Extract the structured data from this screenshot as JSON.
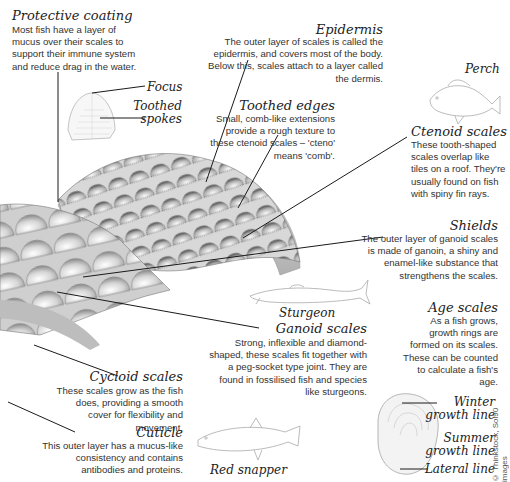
{
  "annotations": {
    "protective_coating": {
      "title": "Protective coating",
      "text": "Most fish have a layer of mucus over their scales to support their immune system and reduce drag in the water."
    },
    "epidermis": {
      "title": "Epidermis",
      "text": "The outer layer of scales is called the epidermis, and covers most of the body. Below this, scales attach to a layer called the dermis."
    },
    "focus": {
      "title": "Focus"
    },
    "toothed_spokes": {
      "title": "Toothed spokes"
    },
    "toothed_edges": {
      "title": "Toothed edges",
      "text": "Small, comb-like extensions provide a rough texture to these ctenoid scales – 'cteno' means 'comb'."
    },
    "ctenoid_scales": {
      "title": "Ctenoid scales",
      "text": "These tooth-shaped scales overlap like tiles on a roof. They're usually found on fish with spiny fin rays."
    },
    "shields": {
      "title": "Shields",
      "text": "The outer layer of ganoid scales is made of ganoin, a shiny and enamel-like substance that strengthens the scales."
    },
    "age_scales": {
      "title": "Age scales",
      "text": "As a fish grows, growth rings are formed on its scales. These can be counted to calculate a fish's age."
    },
    "ganoid_scales": {
      "title": "Ganoid scales",
      "text": "Strong, inflexible and diamond-shaped, these scales fit together with a peg-socket type joint. They are found in fossilised fish and species like sturgeons."
    },
    "cycloid_scales": {
      "title": "Cycloid scales",
      "text": "These scales grow as the fish does, providing a smooth cover for flexibility and movement."
    },
    "cuticle": {
      "title": "Cuticle",
      "text": "This outer layer has a mucus-like consistency and contains antibodies and proteins."
    }
  },
  "fish": {
    "perch": "Perch",
    "sturgeon": "Sturgeon",
    "red_snapper": "Red snapper"
  },
  "scale_labels": {
    "winter": "Winter growth line",
    "winter_l1": "Winter",
    "winter_l2": "growth line",
    "summer_l1": "Summer",
    "summer_l2": "growth line",
    "lateral": "Lateral line"
  },
  "credit": "© Thinkstock, Sol90 images",
  "colors": {
    "ink": "#222222",
    "leader_line": "#1a1a1a",
    "scale_dark": "#6b6b6b",
    "scale_light": "#f2f2f2"
  }
}
